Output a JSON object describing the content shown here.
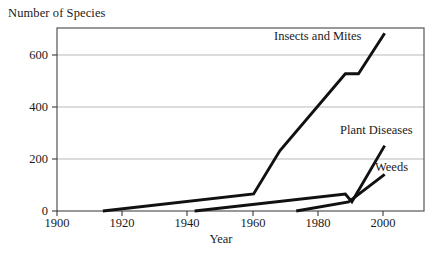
{
  "chart_data": {
    "type": "line",
    "title": "",
    "xlabel": "Year",
    "ylabel": "Number of Species",
    "xlim": [
      1900,
      2012
    ],
    "ylim": [
      0,
      700
    ],
    "xticks": [
      1900,
      1920,
      1940,
      1960,
      1980,
      2000
    ],
    "yticks": [
      0,
      200,
      400,
      600
    ],
    "xtick_labels": [
      "1900",
      "1920",
      "1940",
      "1960",
      "1980",
      "2000"
    ],
    "ytick_labels": [
      "0",
      "200",
      "400",
      "600"
    ],
    "grid": "horizontal-only",
    "grid_color": "#b9b9b9",
    "line_color": "#111111",
    "frame_color": "#555555",
    "legend": "inline-labels",
    "series": [
      {
        "name": "Insects and Mites",
        "label_x": 2000,
        "label_y": 660,
        "x": [
          1914,
          1960,
          1968,
          1988,
          1992,
          2000
        ],
        "values": [
          0,
          65,
          230,
          525,
          525,
          680
        ]
      },
      {
        "name": "Plant Diseases",
        "label_x": 2002,
        "label_y": 300,
        "x": [
          1942,
          1988,
          1990,
          2000
        ],
        "values": [
          0,
          65,
          35,
          250
        ]
      },
      {
        "name": "Weeds",
        "label_x": 2002,
        "label_y": 150,
        "x": [
          1973,
          1989,
          2000
        ],
        "values": [
          0,
          35,
          140
        ]
      }
    ]
  },
  "axes": {
    "y_title": "Number of Species",
    "x_title": "Year",
    "y_ticks": [
      {
        "label": "600"
      },
      {
        "label": "400"
      },
      {
        "label": "200"
      },
      {
        "label": "0"
      }
    ],
    "x_ticks": [
      {
        "label": "1900"
      },
      {
        "label": "1920"
      },
      {
        "label": "1940"
      },
      {
        "label": "1960"
      },
      {
        "label": "1980"
      },
      {
        "label": "2000"
      }
    ]
  },
  "series_labels": {
    "insects": "Insects and Mites",
    "plant_diseases": "Plant Diseases",
    "weeds": "Weeds"
  }
}
